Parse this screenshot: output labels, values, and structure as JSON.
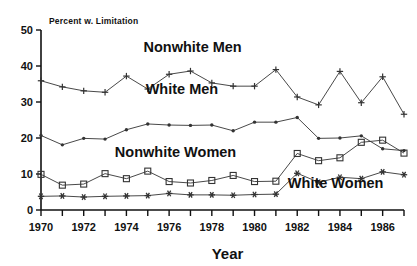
{
  "chart_data": {
    "type": "line",
    "title": "",
    "ylabel": "Percent w. Limitation",
    "xlabel": "Year",
    "ylim": [
      0,
      50
    ],
    "xlim": [
      1970,
      1987
    ],
    "yticks": [
      0,
      10,
      20,
      30,
      40,
      50
    ],
    "ytick_labels": [
      "0",
      "10",
      "20",
      "30",
      "40",
      "50"
    ],
    "xticks": [
      1970,
      1971,
      1972,
      1973,
      1974,
      1975,
      1976,
      1977,
      1978,
      1979,
      1980,
      1981,
      1982,
      1983,
      1984,
      1985,
      1986,
      1987
    ],
    "xtick_labels": [
      "1970",
      "",
      "1972",
      "",
      "1974",
      "",
      "1976",
      "",
      "1978",
      "",
      "1980",
      "",
      "1982",
      "",
      "1984",
      "",
      "1986",
      ""
    ],
    "grid": false,
    "legend_position": "inline-annotations",
    "x": [
      1970,
      1971,
      1972,
      1973,
      1974,
      1975,
      1976,
      1977,
      1978,
      1979,
      1980,
      1981,
      1982,
      1983,
      1984,
      1985,
      1986,
      1987
    ],
    "series": [
      {
        "name": "Nonwhite Men",
        "marker": "plus",
        "color": "#333333",
        "values": [
          35.9,
          34.2,
          33.1,
          32.7,
          37.2,
          33.6,
          37.7,
          38.6,
          35.3,
          34.4,
          34.4,
          39.0,
          31.4,
          29.2,
          38.5,
          29.8,
          37.0,
          26.6
        ],
        "label_x": 1977.1,
        "label_y": 43.8
      },
      {
        "name": "White Men",
        "marker": "dot",
        "color": "#333333",
        "values": [
          20.7,
          18.1,
          19.9,
          19.7,
          22.3,
          23.9,
          23.6,
          23.5,
          23.6,
          22.0,
          24.4,
          24.4,
          25.7,
          19.9,
          20.0,
          20.6,
          17.0,
          16.5
        ],
        "label_x": 1976.6,
        "label_y": 32.3
      },
      {
        "name": "Nonwhite Women",
        "marker": "square",
        "color": "#333333",
        "values": [
          9.9,
          6.9,
          7.2,
          10.1,
          8.7,
          10.8,
          7.9,
          7.5,
          8.2,
          9.6,
          7.9,
          8.0,
          15.7,
          13.7,
          14.5,
          18.8,
          19.4,
          15.8
        ],
        "label_x": 1976.3,
        "label_y": 14.6
      },
      {
        "name": "White Women",
        "marker": "asterisk",
        "color": "#333333",
        "values": [
          3.8,
          3.9,
          3.6,
          3.8,
          3.9,
          4.0,
          4.6,
          4.2,
          4.2,
          4.1,
          4.3,
          4.4,
          10.2,
          7.7,
          9.1,
          8.7,
          10.6,
          9.8
        ],
        "label_x": 1983.8,
        "label_y": 6.1
      }
    ]
  }
}
